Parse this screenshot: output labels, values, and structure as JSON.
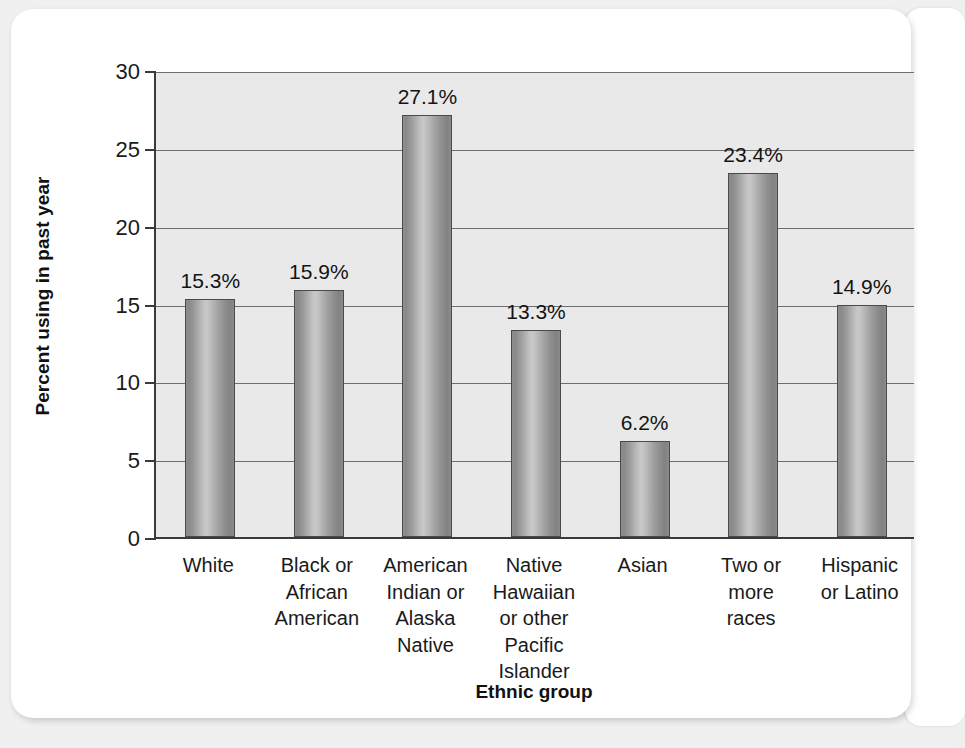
{
  "chart_data": {
    "type": "bar",
    "title": "",
    "xlabel": "Ethnic group",
    "ylabel": "Percent using in past year",
    "ylim": [
      0,
      30
    ],
    "yticks": [
      0,
      5,
      10,
      15,
      20,
      25,
      30
    ],
    "ytick_labels": [
      "0",
      "5",
      "10",
      "15",
      "20",
      "25",
      "30"
    ],
    "grid": true,
    "legend": "none",
    "categories": [
      "White",
      "Black or African American",
      "American Indian or Alaska Native",
      "Native Hawaiian or other Pacific Islander",
      "Asian",
      "Two or more races",
      "Hispanic or Latino"
    ],
    "category_lines": [
      [
        "White"
      ],
      [
        "Black or",
        "African",
        "American"
      ],
      [
        "American",
        "Indian or",
        "Alaska",
        "Native"
      ],
      [
        "Native",
        "Hawaiian",
        "or other",
        "Pacific",
        "Islander"
      ],
      [
        "Asian"
      ],
      [
        "Two or",
        "more",
        "races"
      ],
      [
        "Hispanic",
        "or Latino"
      ]
    ],
    "values": [
      15.3,
      15.9,
      27.1,
      13.3,
      6.2,
      23.4,
      14.9
    ],
    "value_labels": [
      "15.3%",
      "15.9%",
      "27.1%",
      "13.3%",
      "6.2%",
      "23.4%",
      "14.9%"
    ]
  },
  "style": {
    "plot_background": "#e9e9e9",
    "card_background": "#ffffff",
    "page_background": "#f0f0f0",
    "axis_color": "#3a3a3a",
    "gridline_color": "#6e6e6e",
    "bar_fill_light": "#c9c9c9",
    "bar_fill_dark": "#828282",
    "text_color": "#1a1a1a"
  }
}
